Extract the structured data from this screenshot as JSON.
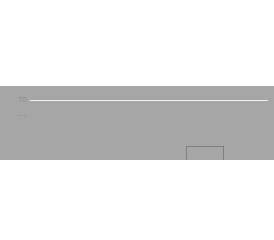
{
  "chart_data": {
    "type": "bar",
    "title": "",
    "subtitle": "",
    "xlabel": "",
    "ylabel": "",
    "categories": [
      "1992",
      "2015"
    ],
    "values": [
      30,
      61
    ],
    "series": [
      {
        "name": "",
        "values": [
          30,
          61
        ]
      }
    ],
    "ylim": [
      0,
      70
    ],
    "ytick_labels": [
      "0",
      "10",
      "20",
      "30",
      "40",
      "50",
      "60",
      "70"
    ],
    "ytick_values": [
      0,
      10,
      20,
      30,
      40,
      50,
      60,
      70
    ],
    "grid": true,
    "grid_axis": "y",
    "legend": false,
    "legend_position": "none",
    "annotations": [],
    "colors": {
      "bar_fill": "#a6a6a6",
      "bar_border": "#7f7f7f",
      "gridline": "#f1f1f1",
      "baseline": "#e3e3e3",
      "tick_text": "#8c8c8c",
      "background": "#ffffff"
    }
  }
}
